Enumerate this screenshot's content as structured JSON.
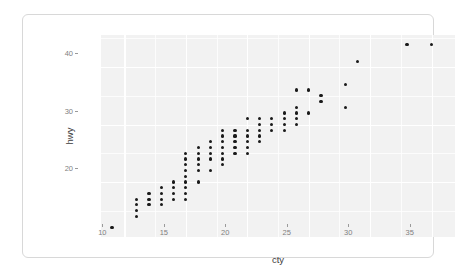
{
  "card": {
    "background": "#ffffff",
    "border_color": "#d8d8d8"
  },
  "chart_data": {
    "type": "scatter",
    "title": "",
    "subtitle": "",
    "xlabel": "cty",
    "ylabel": "hwy",
    "xlim": [
      8.1,
      36.9
    ],
    "ylim": [
      10.4,
      45.6
    ],
    "xticks": [
      10,
      15,
      20,
      25,
      30,
      35
    ],
    "yticks": [
      20,
      30,
      40
    ],
    "x_minor_ticks": [
      12.5,
      17.5,
      22.5,
      27.5,
      32.5
    ],
    "y_minor_ticks": [
      15,
      25,
      35,
      45
    ],
    "grid": true,
    "legend": "none",
    "panel_background": "#f2f2f2",
    "gridline_color": "#ffffff",
    "point_color": "#1a1a1a",
    "point_size": 3.2,
    "n_points": 234,
    "annotations": [],
    "points": [
      [
        9,
        12
      ],
      [
        11,
        14
      ],
      [
        11,
        15
      ],
      [
        11,
        16
      ],
      [
        11,
        17
      ],
      [
        12,
        16
      ],
      [
        12,
        17
      ],
      [
        12,
        18
      ],
      [
        13,
        16
      ],
      [
        13,
        17
      ],
      [
        13,
        18
      ],
      [
        13,
        19
      ],
      [
        14,
        17
      ],
      [
        14,
        18
      ],
      [
        14,
        19
      ],
      [
        14,
        20
      ],
      [
        15,
        17
      ],
      [
        15,
        18
      ],
      [
        15,
        19
      ],
      [
        15,
        20
      ],
      [
        15,
        21
      ],
      [
        15,
        22
      ],
      [
        15,
        23
      ],
      [
        15,
        24
      ],
      [
        15,
        25
      ],
      [
        16,
        20
      ],
      [
        16,
        22
      ],
      [
        16,
        23
      ],
      [
        16,
        24
      ],
      [
        16,
        25
      ],
      [
        16,
        26
      ],
      [
        17,
        22
      ],
      [
        17,
        24
      ],
      [
        17,
        25
      ],
      [
        17,
        26
      ],
      [
        17,
        27
      ],
      [
        18,
        23
      ],
      [
        18,
        24
      ],
      [
        18,
        25
      ],
      [
        18,
        26
      ],
      [
        18,
        27
      ],
      [
        18,
        28
      ],
      [
        18,
        29
      ],
      [
        19,
        25
      ],
      [
        19,
        26
      ],
      [
        19,
        27
      ],
      [
        19,
        28
      ],
      [
        19,
        29
      ],
      [
        20,
        25
      ],
      [
        20,
        26
      ],
      [
        20,
        27
      ],
      [
        20,
        28
      ],
      [
        20,
        29
      ],
      [
        20,
        31
      ],
      [
        21,
        27
      ],
      [
        21,
        28
      ],
      [
        21,
        29
      ],
      [
        21,
        30
      ],
      [
        21,
        31
      ],
      [
        22,
        29
      ],
      [
        22,
        30
      ],
      [
        22,
        31
      ],
      [
        23,
        29
      ],
      [
        23,
        30
      ],
      [
        23,
        31
      ],
      [
        23,
        32
      ],
      [
        24,
        30
      ],
      [
        24,
        31
      ],
      [
        24,
        32
      ],
      [
        24,
        33
      ],
      [
        24,
        36
      ],
      [
        25,
        32
      ],
      [
        25,
        36
      ],
      [
        26,
        34
      ],
      [
        26,
        35
      ],
      [
        28,
        33
      ],
      [
        28,
        37
      ],
      [
        29,
        41
      ],
      [
        33,
        44
      ],
      [
        35,
        44
      ]
    ]
  }
}
